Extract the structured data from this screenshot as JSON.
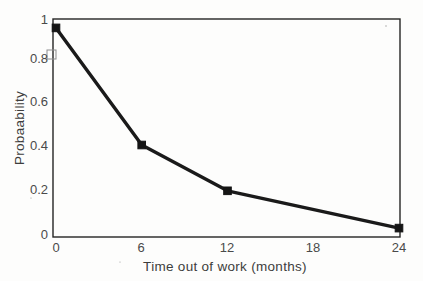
{
  "figure": {
    "background_color": "#fdfdfc",
    "line_color": "#1a1a1a",
    "axis_color": "#242424",
    "text_color": "#4a4a4a"
  },
  "chart_data": {
    "type": "line",
    "title": "",
    "subtitle": "",
    "xlabel": "Time out of work (months)",
    "ylabel": "Probaability",
    "x": [
      0,
      6,
      12,
      24
    ],
    "values": [
      0.97,
      0.42,
      0.205,
      0.03
    ],
    "series": [
      {
        "name": "Probability of return to work",
        "x": [
          0,
          6,
          12,
          24
        ],
        "values": [
          0.97,
          0.42,
          0.205,
          0.03
        ]
      }
    ],
    "xlim": [
      0,
      24
    ],
    "ylim": [
      0,
      1
    ],
    "xticks": [
      0,
      6,
      12,
      18,
      24
    ],
    "xtick_labels": [
      "0",
      "6",
      "12",
      "18",
      "24"
    ],
    "yticks": [
      0,
      0.2,
      0.4,
      0.6,
      0.8,
      1
    ],
    "ytick_labels": [
      "0",
      "0.2",
      "0.4",
      "0.6",
      "0.8",
      "1"
    ],
    "grid": false,
    "legend": false,
    "legend_position": "none",
    "marker": "square",
    "annotations": []
  },
  "axes": {
    "y_label": "Probaability",
    "x_label": "Time out of work (months)",
    "y_ticks": [
      "1",
      "0.8",
      "0.6",
      "0.4",
      "0.2",
      "0"
    ],
    "x_ticks": [
      "0",
      "6",
      "12",
      "18",
      "24"
    ]
  }
}
